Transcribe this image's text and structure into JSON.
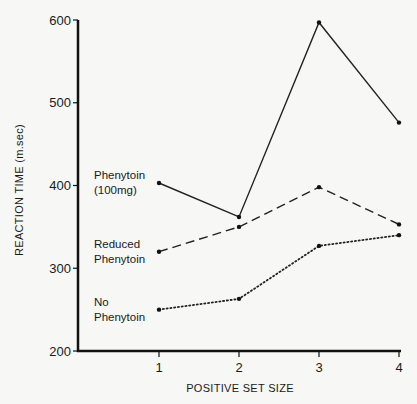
{
  "chart_data": {
    "type": "line",
    "title": "",
    "xlabel": "POSITIVE SET SIZE",
    "ylabel": "REACTION TIME (m.sec)",
    "x": [
      1,
      2,
      3,
      4
    ],
    "x_tick_labels": [
      "1",
      "2",
      "3",
      "4"
    ],
    "y_tick_labels": [
      "200",
      "300",
      "400",
      "500",
      "600"
    ],
    "ylim": [
      200,
      600
    ],
    "grid": false,
    "legend_position": "inline labels at left of each line",
    "series": [
      {
        "name": "Phenytoin (100mg)",
        "label_lines": [
          "Phenytoin",
          "(100mg)"
        ],
        "style": "solid",
        "values": [
          403,
          362,
          597,
          476
        ]
      },
      {
        "name": "Reduced Phenytoin",
        "label_lines": [
          "Reduced",
          "Phenytoin"
        ],
        "style": "dashed",
        "values": [
          320,
          350,
          398,
          353
        ]
      },
      {
        "name": "No Phenytoin",
        "label_lines": [
          "No",
          "Phenytoin"
        ],
        "style": "dotted",
        "values": [
          250,
          263,
          327,
          340
        ]
      }
    ]
  }
}
